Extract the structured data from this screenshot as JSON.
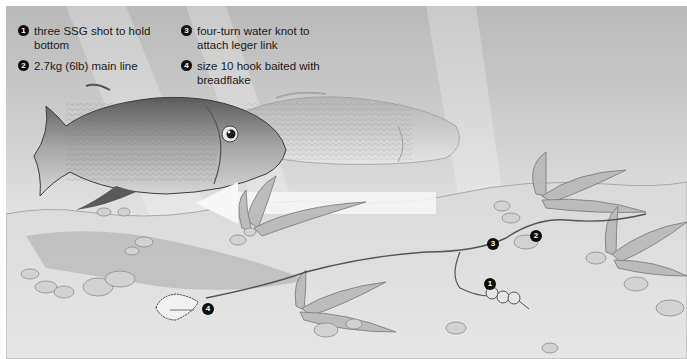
{
  "figure": {
    "style": "grayscale underwater illustration",
    "colors": {
      "background_top": "#b9b9b9",
      "background_bottom": "#dadada",
      "riverbed": "#e0e0e0",
      "marker": "#0d0d0d",
      "arrow": "#f7f7f7"
    }
  },
  "legend": {
    "items": [
      {
        "number": "1",
        "text": "three SSG shot to hold bottom"
      },
      {
        "number": "2",
        "text": "2.7kg (6lb) main line"
      },
      {
        "number": "3",
        "text": "four-turn water knot to attach leger link"
      },
      {
        "number": "4",
        "text": "size 10 hook baited with breadflake"
      }
    ]
  },
  "markers": [
    {
      "number": "1",
      "label": "SSG shot"
    },
    {
      "number": "2",
      "label": "main line"
    },
    {
      "number": "3",
      "label": "water knot"
    },
    {
      "number": "4",
      "label": "hook with breadflake"
    }
  ],
  "scene": {
    "elements": [
      "foreground chub",
      "background chub",
      "direction arrow pointing left",
      "weed clumps",
      "pebbles",
      "riverbed"
    ]
  }
}
